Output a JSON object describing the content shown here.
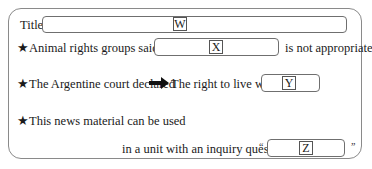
{
  "title_row": {
    "label": "Title",
    "placeholder_tag": "W"
  },
  "row_animal": {
    "star": "★",
    "lead": "Animal rights groups said that",
    "placeholder_tag": "X",
    "tail": "is not appropriate"
  },
  "row_court": {
    "star": "★",
    "lead": "The Argentine court declared",
    "arrow_icon": "right-arrow",
    "follow": "The right to live with",
    "placeholder_tag": "Y"
  },
  "row_usage": {
    "star": "★",
    "lead": "This news material can be used",
    "second_line": "in a unit with an inquiry question",
    "open_quote": "“",
    "placeholder_tag": "Z",
    "close_quote": "”"
  }
}
